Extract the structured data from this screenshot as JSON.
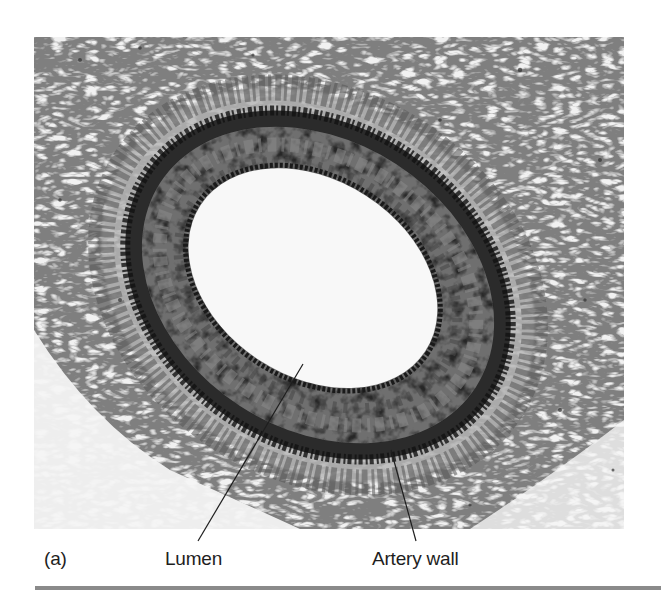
{
  "figure": {
    "panel_label": "(a)",
    "labels": {
      "lumen": "Lumen",
      "artery_wall": "Artery wall"
    },
    "colors": {
      "background": "#ffffff",
      "lumen": "#f7f7f7",
      "media": "#6e6e6e",
      "adventitia_dark": "#2a2a2a",
      "connective_tissue": "#9a9a9a",
      "rule": "#8a8a8a",
      "label_text": "#1e1e1e"
    }
  }
}
